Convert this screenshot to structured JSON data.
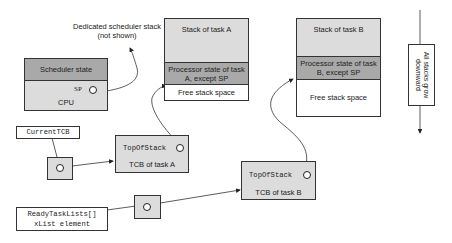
{
  "annotation": {
    "scheduler_stack": "Dedicated scheduler stack (not shown)"
  },
  "cpu": {
    "state_label": "Scheduler state",
    "sp_label": "SP",
    "label": "CPU"
  },
  "task_a_stack": {
    "title": "Stack of task A",
    "processor_state": "Processor state of task A, except SP",
    "free": "Free stack space"
  },
  "task_b_stack": {
    "title": "Stack of task B",
    "processor_state": "Processor state of task B, except SP",
    "free": "Free stack space"
  },
  "growth_note": {
    "text": "All stacks grow downward"
  },
  "current_tcb": {
    "label": "CurrentTCB"
  },
  "tcb_a": {
    "field": "TopOfStack",
    "label": "TCB of task A"
  },
  "tcb_b": {
    "field": "TopOfStack",
    "label": "TCB of task B"
  },
  "ready_list": {
    "label_line1": "ReadyTaskLists[]",
    "label_line2": "xList element"
  },
  "colors": {
    "dark_fill": "#a9a9a9",
    "light_fill": "#dcdcdc",
    "stroke": "#333333"
  }
}
